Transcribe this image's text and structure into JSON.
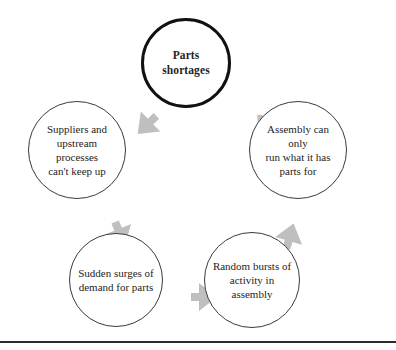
{
  "diagram": {
    "type": "cycle-diagram",
    "title_node": "Parts shortages",
    "arrow_color": "#bfbfbf",
    "primary_border_color": "#111111",
    "secondary_border_color": "#3a3a3a",
    "text_color": "#242424",
    "nodes": [
      {
        "id": "parts-shortages",
        "label": "Parts shortages",
        "emphasis": "primary",
        "cx": 186,
        "cy": 63,
        "r": 45
      },
      {
        "id": "assembly-can-only-run",
        "label": "Assembly can only\nrun what it has\nparts for",
        "emphasis": "secondary",
        "cx": 298,
        "cy": 150,
        "r": 49
      },
      {
        "id": "random-bursts-of-activity",
        "label": "Random bursts of\nactivity in assembly",
        "emphasis": "secondary",
        "cx": 252,
        "cy": 280,
        "r": 48
      },
      {
        "id": "sudden-surges-of-demand",
        "label": "Sudden surges of\ndemand for parts",
        "emphasis": "secondary",
        "cx": 116,
        "cy": 280,
        "r": 47
      },
      {
        "id": "suppliers-upstream-processes",
        "label": "Suppliers and\nupstream processes\ncan't keep up",
        "emphasis": "secondary",
        "cx": 77,
        "cy": 150,
        "r": 49
      }
    ],
    "arrows": [
      {
        "id": "arrow-shortages-to-assembly",
        "from": "parts-shortages",
        "to": "assembly-can-only-run",
        "cx": 246,
        "cy": 104,
        "rotation": 137
      },
      {
        "id": "arrow-assembly-to-bursts",
        "from": "assembly-can-only-run",
        "to": "random-bursts-of-activity",
        "cx": 270,
        "cy": 216,
        "rotation": 196
      },
      {
        "id": "arrow-bursts-to-surges",
        "from": "random-bursts-of-activity",
        "to": "sudden-surges-of-demand",
        "cx": 184,
        "cy": 277,
        "rotation": 270
      },
      {
        "id": "arrow-surges-to-suppliers",
        "from": "sudden-surges-of-demand",
        "to": "suppliers-upstream-processes",
        "cx": 100,
        "cy": 214,
        "rotation": 338
      },
      {
        "id": "arrow-suppliers-to-shortages",
        "from": "suppliers-upstream-processes",
        "to": "parts-shortages",
        "cx": 127,
        "cy": 105,
        "rotation": 46
      }
    ],
    "bottom_rule": {
      "y": 341
    }
  }
}
